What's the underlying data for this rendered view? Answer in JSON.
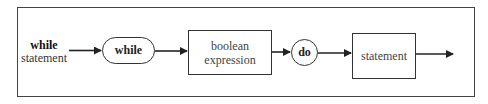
{
  "diagram": {
    "type": "syntax-diagram",
    "start_label": {
      "line1": "while",
      "line2": "statement"
    },
    "nodes": [
      {
        "id": "keyword-while",
        "shape": "rounded-pill",
        "text": "while"
      },
      {
        "id": "boolean-expression",
        "shape": "rectangle",
        "line1": "boolean",
        "line2": "expression"
      },
      {
        "id": "keyword-do",
        "shape": "circle",
        "text": "do"
      },
      {
        "id": "statement",
        "shape": "rectangle",
        "text": "statement"
      }
    ],
    "edges": [
      {
        "from": "start",
        "to": "keyword-while"
      },
      {
        "from": "keyword-while",
        "to": "boolean-expression"
      },
      {
        "from": "boolean-expression",
        "to": "keyword-do"
      },
      {
        "from": "keyword-do",
        "to": "statement"
      },
      {
        "from": "statement",
        "to": "exit"
      }
    ],
    "colors": {
      "line": "#333333",
      "background": "#ffffff"
    }
  }
}
